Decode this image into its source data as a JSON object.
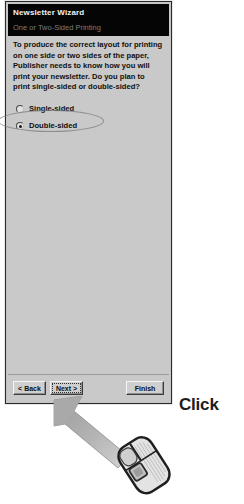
{
  "dialog": {
    "title": "Newsletter Wizard",
    "subtitle": "One or Two-Sided Printing",
    "instruction": "To produce the correct layout for printing on one side or two sides of the paper, Publisher needs to know how you will print your newsletter. Do you plan to print single-sided or double-sided?",
    "options": [
      {
        "label": "Single-sided",
        "selected": false
      },
      {
        "label": "Double-sided",
        "selected": true
      }
    ],
    "buttons": {
      "back": "< Back",
      "next": "Next >",
      "finish": "Finish"
    }
  },
  "annotation": {
    "click_label": "Click"
  },
  "colors": {
    "dialog_face": "#c9c9c9",
    "title_bar": "#050505",
    "title_text": "#f2f2f2",
    "subtitle_text": "#7d7d7d",
    "arrow_fill": "#a6a6a6",
    "page_background": "#ffffff"
  }
}
